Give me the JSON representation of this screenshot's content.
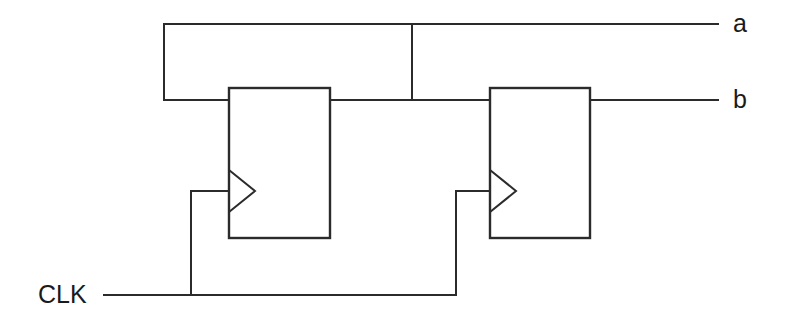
{
  "diagram": {
    "type": "digital-logic-schematic",
    "background_color": "#ffffff",
    "line_color": "#2b2b2b",
    "label_color": "#1a1a1a"
  },
  "signals": {
    "clock_label": "CLK",
    "output_a_label": "a",
    "output_b_label": "b"
  },
  "flipflops": [
    {
      "id": "ff1",
      "name": "flip-flop-1",
      "x": 229,
      "y": 88,
      "width": 101,
      "height": 150,
      "clock_notch_y": 191
    },
    {
      "id": "ff2",
      "name": "flip-flop-2",
      "x": 490,
      "y": 88,
      "width": 100,
      "height": 150,
      "clock_notch_y": 191
    }
  ],
  "wires": {
    "feedback_top_y": 24,
    "data_line_y": 100,
    "feedback_left_x": 164,
    "feedback_tap_x": 412,
    "clock_bus_y": 295,
    "clock_riser_1_x": 191,
    "clock_riser_2_x": 456,
    "clock_stub_y": 191,
    "output_end_x": 718,
    "clk_line_start_x": 104
  },
  "labels": {
    "clk_x": 38,
    "clk_y": 295,
    "a_x": 733,
    "a_y": 24,
    "b_x": 733,
    "b_y": 100
  }
}
